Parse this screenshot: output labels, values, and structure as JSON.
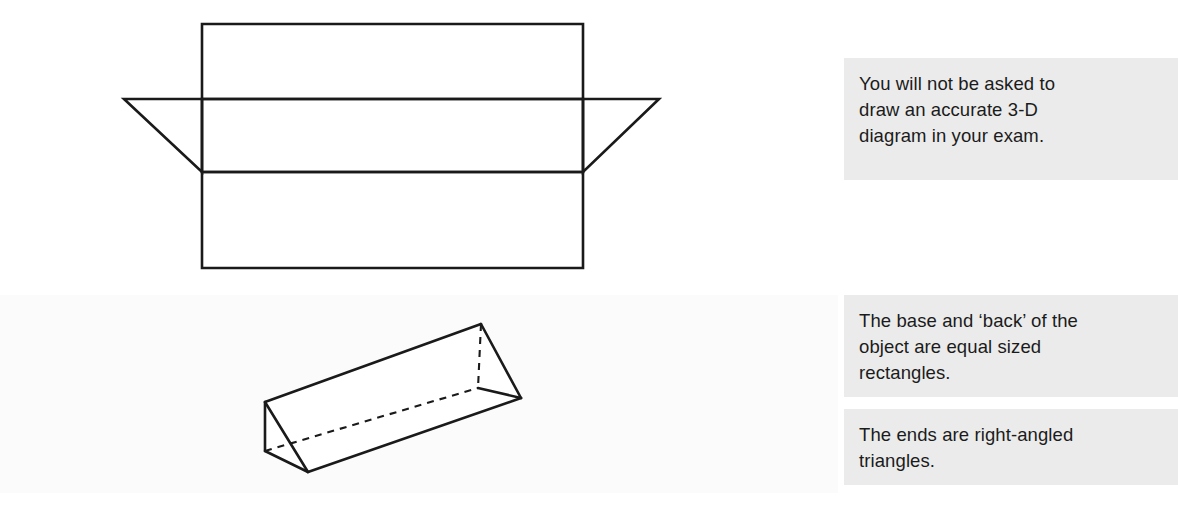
{
  "page": {
    "background_color": "#ffffff",
    "ink_color": "#1a1a1a",
    "note_background_color": "#ebebeb",
    "note_text_color": "#1b1b1b"
  },
  "figures": {
    "net": {
      "name": "net-of-triangular-prism",
      "description": "Net of a triangular prism: three stacked rectangles with a right-angled triangle flap on each side of the middle rectangle",
      "stroke_color": "#1a1a1a",
      "stroke_width": 2.6,
      "parts": [
        "top rectangle",
        "middle rectangle",
        "bottom rectangle",
        "left triangle flap",
        "right triangle flap"
      ]
    },
    "prism": {
      "name": "three-dimensional-triangular-prism",
      "description": "Oblique 3-D drawing of a triangular prism lying on its rectangular base, hidden edges shown as dashed lines",
      "stroke_color": "#1a1a1a",
      "stroke_width": 2.6,
      "hidden_edge_style": "dashed"
    }
  },
  "notes": [
    {
      "id": "note-exam",
      "text": "You will not be asked to\ndraw an accurate 3-D\ndiagram in your exam."
    },
    {
      "id": "note-base-back",
      "text": "The base and ‘back’ of the\nobject are equal sized\nrectangles."
    },
    {
      "id": "note-ends",
      "text": "The ends are right-angled\ntriangles."
    }
  ]
}
